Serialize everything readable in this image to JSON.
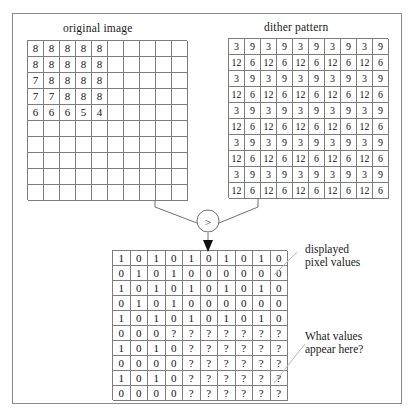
{
  "figure": {
    "captions": {
      "original": "original image",
      "dither": "dither pattern"
    },
    "labels": {
      "displayed_line1": "displayed",
      "displayed_line2": "pixel values",
      "question_line1": "What values",
      "question_line2": "appear here?"
    },
    "operator": {
      "symbol": ">",
      "name": "greater-than-comparator"
    },
    "colors": {
      "grid_line": "#7d7d7d",
      "frame": "#8a8a8a",
      "text": "#1a1a1a",
      "background": "#ffffff"
    }
  },
  "chart_data": {
    "type": "table",
    "grids": [
      {
        "name": "original image",
        "rows": 10,
        "cols": 10,
        "values": [
          [
            "8",
            "8",
            "8",
            "8",
            "8",
            "",
            "",
            "",
            "",
            ""
          ],
          [
            "8",
            "8",
            "8",
            "8",
            "8",
            "",
            "",
            "",
            "",
            ""
          ],
          [
            "7",
            "8",
            "8",
            "8",
            "8",
            "",
            "",
            "",
            "",
            ""
          ],
          [
            "7",
            "7",
            "8",
            "8",
            "8",
            "",
            "",
            "",
            "",
            ""
          ],
          [
            "6",
            "6",
            "6",
            "5",
            "4",
            "",
            "",
            "",
            "",
            ""
          ],
          [
            "",
            "",
            "",
            "",
            "",
            "",
            "",
            "",
            "",
            ""
          ],
          [
            "",
            "",
            "",
            "",
            "",
            "",
            "",
            "",
            "",
            ""
          ],
          [
            "",
            "",
            "",
            "",
            "",
            "",
            "",
            "",
            "",
            ""
          ],
          [
            "",
            "",
            "",
            "",
            "",
            "",
            "",
            "",
            "",
            ""
          ],
          [
            "",
            "",
            "",
            "",
            "",
            "",
            "",
            "",
            "",
            ""
          ]
        ]
      },
      {
        "name": "dither pattern",
        "rows": 10,
        "cols": 10,
        "values": [
          [
            "3",
            "9",
            "3",
            "9",
            "3",
            "9",
            "3",
            "9",
            "3",
            "9"
          ],
          [
            "12",
            "6",
            "12",
            "6",
            "12",
            "6",
            "12",
            "6",
            "12",
            "6"
          ],
          [
            "3",
            "9",
            "3",
            "9",
            "3",
            "9",
            "3",
            "9",
            "3",
            "9"
          ],
          [
            "12",
            "6",
            "12",
            "6",
            "12",
            "6",
            "12",
            "6",
            "12",
            "6"
          ],
          [
            "3",
            "9",
            "3",
            "9",
            "3",
            "9",
            "3",
            "9",
            "3",
            "9"
          ],
          [
            "12",
            "6",
            "12",
            "6",
            "12",
            "6",
            "12",
            "6",
            "12",
            "6"
          ],
          [
            "3",
            "9",
            "3",
            "9",
            "3",
            "9",
            "3",
            "9",
            "3",
            "9"
          ],
          [
            "12",
            "6",
            "12",
            "6",
            "12",
            "6",
            "12",
            "6",
            "12",
            "6"
          ],
          [
            "3",
            "9",
            "3",
            "9",
            "3",
            "9",
            "3",
            "9",
            "3",
            "9"
          ],
          [
            "12",
            "6",
            "12",
            "6",
            "12",
            "6",
            "12",
            "6",
            "12",
            "6"
          ]
        ]
      },
      {
        "name": "displayed pixel values",
        "rows": 10,
        "cols": 10,
        "values": [
          [
            "1",
            "0",
            "1",
            "0",
            "1",
            "0",
            "1",
            "0",
            "1",
            "0"
          ],
          [
            "0",
            "1",
            "0",
            "1",
            "0",
            "0",
            "0",
            "0",
            "0",
            "0"
          ],
          [
            "1",
            "0",
            "1",
            "0",
            "1",
            "0",
            "1",
            "0",
            "1",
            "0"
          ],
          [
            "0",
            "1",
            "0",
            "1",
            "0",
            "0",
            "0",
            "0",
            "0",
            "0"
          ],
          [
            "1",
            "0",
            "1",
            "0",
            "1",
            "0",
            "1",
            "0",
            "1",
            "0"
          ],
          [
            "0",
            "0",
            "0",
            "?",
            "?",
            "?",
            "?",
            "?",
            "?",
            "?"
          ],
          [
            "1",
            "0",
            "1",
            "0",
            "?",
            "?",
            "?",
            "?",
            "?",
            "?"
          ],
          [
            "0",
            "0",
            "0",
            "0",
            "?",
            "?",
            "?",
            "?",
            "?",
            "?"
          ],
          [
            "1",
            "0",
            "1",
            "0",
            "?",
            "?",
            "?",
            "?",
            "?",
            "?"
          ],
          [
            "0",
            "0",
            "0",
            "0",
            "?",
            "?",
            "?",
            "?",
            "?",
            "?"
          ]
        ]
      }
    ]
  }
}
